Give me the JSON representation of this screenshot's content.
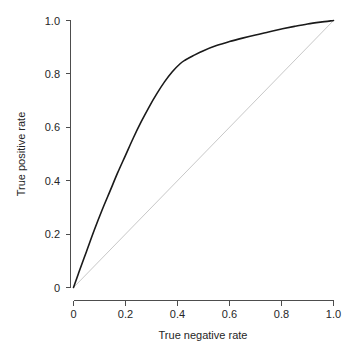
{
  "chart_data": {
    "type": "line",
    "title": "",
    "xlabel": "True negative rate",
    "ylabel": "True positive rate",
    "xlim": [
      0,
      1
    ],
    "ylim": [
      0,
      1
    ],
    "grid": false,
    "legend": "none",
    "xticks": [
      "0",
      "0.2",
      "0.4",
      "0.6",
      "0.8",
      "1.0"
    ],
    "xtick_values": [
      0,
      0.2,
      0.4,
      0.6,
      0.8,
      1.0
    ],
    "yticks": [
      "0",
      "0.2",
      "0.4",
      "0.6",
      "0.8",
      "1.0"
    ],
    "ytick_values": [
      0,
      0.2,
      0.4,
      0.6,
      0.8,
      1.0
    ],
    "series": [
      {
        "name": "ROC curve",
        "color": "#1a1a1a",
        "x": [
          0.0,
          0.02,
          0.05,
          0.08,
          0.11,
          0.14,
          0.17,
          0.2,
          0.23,
          0.26,
          0.29,
          0.32,
          0.35,
          0.38,
          0.41,
          0.43,
          0.46,
          0.5,
          0.55,
          0.6,
          0.65,
          0.7,
          0.75,
          0.8,
          0.85,
          0.9,
          0.95,
          1.0
        ],
        "y": [
          0.0,
          0.055,
          0.135,
          0.215,
          0.29,
          0.36,
          0.43,
          0.495,
          0.56,
          0.62,
          0.675,
          0.725,
          0.77,
          0.808,
          0.838,
          0.852,
          0.868,
          0.887,
          0.906,
          0.921,
          0.934,
          0.946,
          0.957,
          0.968,
          0.978,
          0.987,
          0.994,
          1.0
        ]
      },
      {
        "name": "chance diagonal",
        "color": "#c8c8c8",
        "x": [
          0.0,
          1.0
        ],
        "y": [
          0.0,
          1.0
        ]
      }
    ]
  },
  "axes": {
    "x_title": "True negative rate",
    "y_title": "True positive rate"
  }
}
